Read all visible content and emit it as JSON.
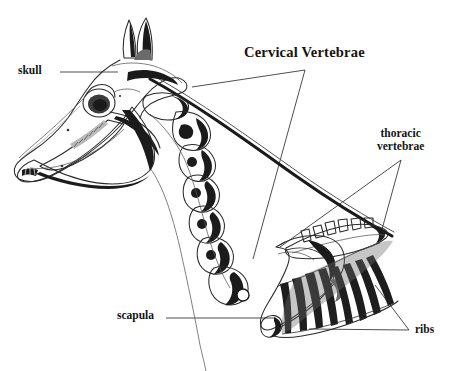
{
  "figure": {
    "style": "pen-and-ink anatomical illustration",
    "background_color": "#ffffff",
    "ink_color": "#1a1a1a",
    "width": 453,
    "height": 371
  },
  "labels": {
    "skull": "skull",
    "cervical": "Cervical Vertebrae",
    "thoracic_line1": "thoracic",
    "thoracic_line2": "vertebrae",
    "scapula": "scapula",
    "ribs": "ribs"
  },
  "annotations": [
    {
      "name": "skull",
      "text": "skull",
      "leader": "straight",
      "from": [
        60,
        72
      ],
      "to": [
        118,
        72
      ]
    },
    {
      "name": "cervical-vertebrae",
      "text": "Cervical Vertebrae",
      "leader": "bracket-v",
      "apex": [
        305,
        70
      ],
      "targets": [
        [
          192,
          87
        ],
        [
          253,
          259
        ]
      ]
    },
    {
      "name": "thoracic-vertebrae",
      "text": "thoracic vertebrae",
      "leader": "bracket-v",
      "apex": [
        401,
        160
      ],
      "targets": [
        [
          280,
          247
        ],
        [
          381,
          233
        ]
      ]
    },
    {
      "name": "scapula",
      "text": "scapula",
      "leader": "straight",
      "from": [
        166,
        318
      ],
      "to": [
        274,
        318
      ]
    },
    {
      "name": "ribs",
      "text": "ribs",
      "leader": "bracket-v",
      "apex": [
        409,
        330
      ],
      "targets": [
        [
          375,
          285
        ],
        [
          309,
          329
        ]
      ]
    }
  ],
  "parts": [
    {
      "name": "ears",
      "count": 2
    },
    {
      "name": "cranium"
    },
    {
      "name": "orbit-eye-socket"
    },
    {
      "name": "nasal-bone"
    },
    {
      "name": "upper-tooth-row"
    },
    {
      "name": "lower-jaw-mandible"
    },
    {
      "name": "cervical-vertebrae-chain",
      "count": 7
    },
    {
      "name": "thoracic-vertebrae-spines",
      "count": 6
    },
    {
      "name": "scapula"
    },
    {
      "name": "rib-cage",
      "count": 8
    },
    {
      "name": "neck-outline"
    },
    {
      "name": "crest-line"
    }
  ]
}
